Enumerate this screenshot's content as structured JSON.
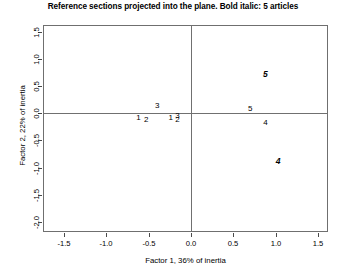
{
  "chart_data": {
    "type": "scatter",
    "title": "Reference sections projected into the plane. Bold italic: 5 articles",
    "xlabel": "Factor 1, 36% of inertia",
    "ylabel": "Factor 2, 22% of inertia",
    "xlim": [
      -1.75,
      1.62
    ],
    "ylim": [
      -2.18,
      1.62
    ],
    "xticks": [
      "-1.5",
      "-1.0",
      "-0.5",
      "0.0",
      "0.5",
      "1.0",
      "1.5"
    ],
    "xtick_values": [
      -1.5,
      -1.0,
      -0.5,
      0.0,
      0.5,
      1.0,
      1.5
    ],
    "yticks": [
      "1.5",
      "1.0",
      "0.5",
      "0.0",
      "-0.5",
      "-1.0",
      "-1.5",
      "-2.0"
    ],
    "ytick_values": [
      1.5,
      1.0,
      0.5,
      0.0,
      -0.5,
      -1.0,
      -1.5,
      -2.0
    ],
    "grid": false,
    "legend": "none",
    "zero_lines": {
      "x": 0.0,
      "y": 0.0
    },
    "annotations": [
      {
        "label": "3",
        "x": -0.4,
        "y": 0.14,
        "style": "plain"
      },
      {
        "label": "1",
        "x": -0.62,
        "y": -0.09,
        "style": "plain"
      },
      {
        "label": "2",
        "x": -0.53,
        "y": -0.13,
        "style": "plain"
      },
      {
        "label": "1",
        "x": -0.24,
        "y": -0.08,
        "style": "plain"
      },
      {
        "label": "3",
        "x": -0.16,
        "y": -0.05,
        "style": "plain"
      },
      {
        "label": "2",
        "x": -0.16,
        "y": -0.12,
        "style": "plain"
      },
      {
        "label": "5",
        "x": 0.88,
        "y": 0.72,
        "style": "bolditalic"
      },
      {
        "label": "5",
        "x": 0.7,
        "y": 0.07,
        "style": "plain"
      },
      {
        "label": "4",
        "x": 0.88,
        "y": -0.17,
        "style": "plain"
      },
      {
        "label": "4",
        "x": 1.03,
        "y": -0.88,
        "style": "bolditalic"
      }
    ]
  }
}
